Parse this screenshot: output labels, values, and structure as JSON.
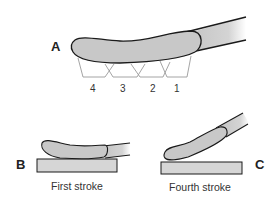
{
  "figure": {
    "panels": {
      "A": {
        "label": "A",
        "segments": [
          "4",
          "3",
          "2",
          "1"
        ]
      },
      "B": {
        "label": "B",
        "caption": "First stroke"
      },
      "C": {
        "label": "C",
        "caption": "Fourth stroke"
      }
    },
    "colors": {
      "brush_fill": "#c8c8c8",
      "outline": "#1a1a1a",
      "surface_fill": "#d6d6d6",
      "segment_line": "#9a9a9a"
    }
  }
}
